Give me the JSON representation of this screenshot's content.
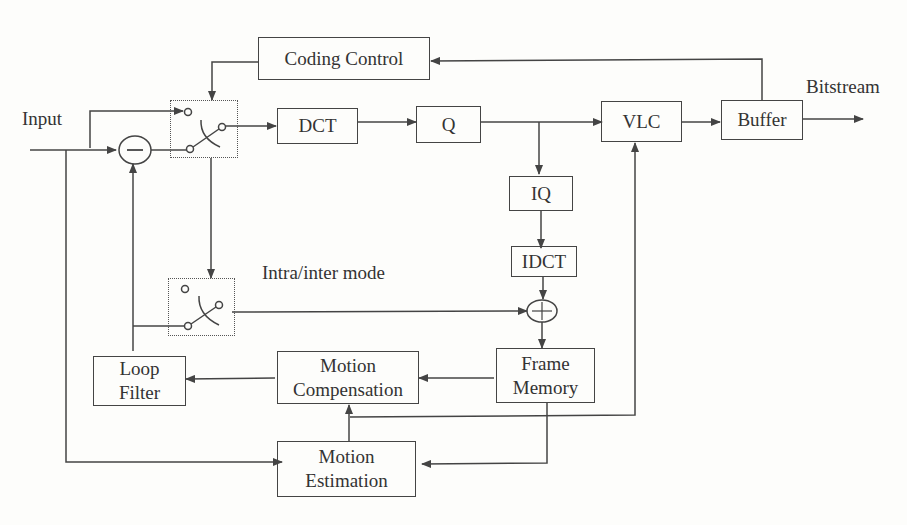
{
  "diagram": {
    "labels": {
      "input": "Input",
      "bitstream": "Bitstream",
      "mode": "Intra/inter mode"
    },
    "blocks": {
      "coding_control": "Coding Control",
      "dct": "DCT",
      "q": "Q",
      "vlc": "VLC",
      "buffer": "Buffer",
      "iq": "IQ",
      "idct": "IDCT",
      "frame_memory_1": "Frame",
      "frame_memory_2": "Memory",
      "motion_comp_1": "Motion",
      "motion_comp_2": "Compensation",
      "loop_filter_1": "Loop",
      "loop_filter_2": "Filter",
      "motion_est_1": "Motion",
      "motion_est_2": "Estimation"
    },
    "operators": {
      "subtract": "−",
      "add": "+"
    },
    "colors": {
      "line": "#444444",
      "background": "#fdfdfb"
    }
  }
}
